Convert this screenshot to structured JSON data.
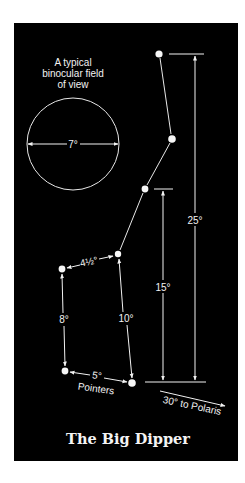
{
  "figure": {
    "title": "The Big Dipper",
    "background_color": "#000000",
    "foreground_color": "#f2f2f2"
  },
  "binocular_field": {
    "caption_lines": [
      "A typical",
      "binocular field",
      "of view"
    ],
    "diameter_label": "7°"
  },
  "stars": [
    {
      "name": "star-1",
      "x": 159,
      "y": 54
    },
    {
      "name": "star-2",
      "x": 172,
      "y": 139
    },
    {
      "name": "star-3",
      "x": 145,
      "y": 189
    },
    {
      "name": "star-4",
      "x": 118,
      "y": 254
    },
    {
      "name": "star-5",
      "x": 62,
      "y": 269
    },
    {
      "name": "star-6",
      "x": 65,
      "y": 371
    },
    {
      "name": "star-7",
      "x": 132,
      "y": 383
    }
  ],
  "distance_labels": {
    "handle_bowl_gap": "4½°",
    "left_side": "8°",
    "right_side": "10°",
    "pointers": "5°",
    "pointers_caption": "Pointers",
    "span_15": "15°",
    "span_25": "25°",
    "to_polaris": "30° to Polaris"
  }
}
